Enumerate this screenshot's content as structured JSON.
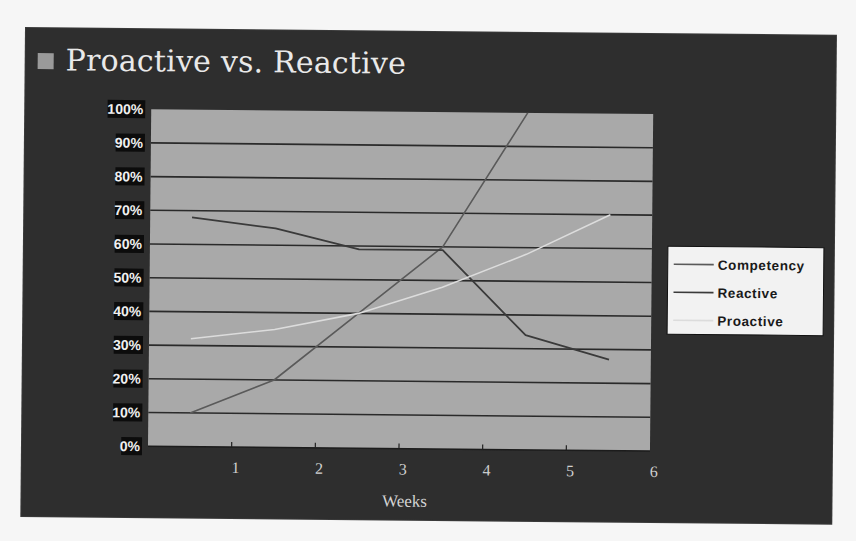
{
  "slide": {
    "title": "Proactive vs. Reactive",
    "bullet_icon": "square-bullet-icon"
  },
  "colors": {
    "slide_background": "#2e2e2e",
    "plot_background": "#a9a9a9",
    "gridline": "#2a2a2a",
    "competency": "#5a5a5a",
    "reactive": "#3a3a3a",
    "proactive": "#dcdcdc",
    "legend_background": "#f2f2f2"
  },
  "chart_data": {
    "type": "line",
    "title": "Proactive vs. Reactive",
    "xlabel": "Weeks",
    "ylabel": "",
    "x_tick_labels": [
      "1",
      "2",
      "3",
      "4",
      "5",
      "6"
    ],
    "y_tick_labels": [
      "0%",
      "10%",
      "20%",
      "30%",
      "40%",
      "50%",
      "60%",
      "70%",
      "80%",
      "90%",
      "100%"
    ],
    "ylim": [
      0,
      100
    ],
    "x": [
      0.5,
      1.5,
      2.5,
      3.5,
      4.5,
      5.5
    ],
    "grid": true,
    "legend_position": "right",
    "series": [
      {
        "name": "Competency",
        "values": [
          10,
          20,
          40,
          60,
          100,
          null
        ],
        "note": "line exceeds 100% and is clipped at top of plot"
      },
      {
        "name": "Reactive",
        "values": [
          68,
          65,
          59,
          59,
          34,
          27
        ]
      },
      {
        "name": "Proactive",
        "values": [
          32,
          35,
          40,
          48,
          58,
          70
        ]
      }
    ]
  },
  "legend": {
    "items": [
      {
        "label": "Competency"
      },
      {
        "label": "Reactive"
      },
      {
        "label": "Proactive"
      }
    ]
  }
}
